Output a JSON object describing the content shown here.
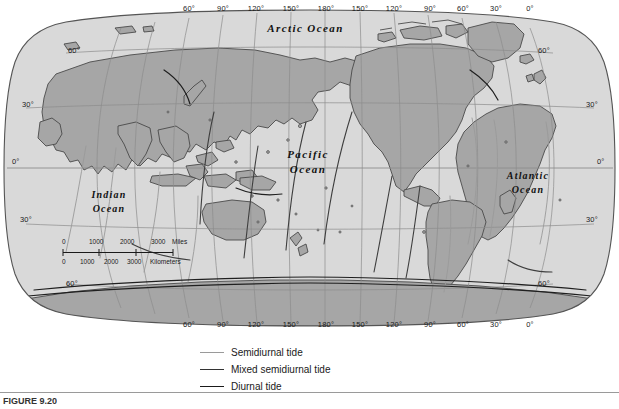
{
  "figure": {
    "caption": "FIGURE 9.20",
    "projection": "robinson-world"
  },
  "map": {
    "ocean_labels": [
      {
        "name": "arctic-ocean",
        "line1": "Arctic  Ocean",
        "x": 248,
        "y": 22,
        "w": 115,
        "size": "normal"
      },
      {
        "name": "pacific-ocean",
        "line1": "Pacific",
        "line2": "Ocean",
        "x": 272,
        "y": 148,
        "w": 72,
        "size": "normal"
      },
      {
        "name": "indian-ocean",
        "line1": "Indian",
        "line2": "Ocean",
        "x": 78,
        "y": 189,
        "w": 62,
        "size": "small"
      },
      {
        "name": "atlantic-ocean",
        "line1": "Atlantic",
        "line2": "Ocean",
        "x": 492,
        "y": 170,
        "w": 72,
        "size": "small"
      }
    ],
    "longitude_labels_top": [
      {
        "text": "60°",
        "x": 188
      },
      {
        "text": "90°",
        "x": 222
      },
      {
        "text": "120°",
        "x": 255
      },
      {
        "text": "150°",
        "x": 290
      },
      {
        "text": "180°",
        "x": 325
      },
      {
        "text": "150°",
        "x": 359
      },
      {
        "text": "120°",
        "x": 393
      },
      {
        "text": "90°",
        "x": 429
      },
      {
        "text": "60°",
        "x": 462
      },
      {
        "text": "30°",
        "x": 495
      },
      {
        "text": "0°",
        "x": 529
      }
    ],
    "longitude_labels_bottom": [
      {
        "text": "60°",
        "x": 188
      },
      {
        "text": "90°",
        "x": 222
      },
      {
        "text": "120°",
        "x": 255
      },
      {
        "text": "150°",
        "x": 290
      },
      {
        "text": "180°",
        "x": 325
      },
      {
        "text": "150°",
        "x": 359
      },
      {
        "text": "120°",
        "x": 393
      },
      {
        "text": "90°",
        "x": 429
      },
      {
        "text": "60°",
        "x": 462
      },
      {
        "text": "30°",
        "x": 495
      },
      {
        "text": "0°",
        "x": 529
      }
    ],
    "latitude_labels_left": [
      {
        "text": "60°",
        "x": 68,
        "y": 50
      },
      {
        "text": "30°",
        "x": 22,
        "y": 104
      },
      {
        "text": "0°",
        "x": 12,
        "y": 161
      },
      {
        "text": "30°",
        "x": 20,
        "y": 219
      },
      {
        "text": "60°",
        "x": 66,
        "y": 283
      }
    ],
    "latitude_labels_right": [
      {
        "text": "60°",
        "x": 538,
        "y": 50
      },
      {
        "text": "30°",
        "x": 586,
        "y": 104
      },
      {
        "text": "0°",
        "x": 597,
        "y": 161
      },
      {
        "text": "30°",
        "x": 586,
        "y": 219
      },
      {
        "text": "60°",
        "x": 538,
        "y": 283
      }
    ],
    "colors": {
      "land": "#a6a6a6",
      "ocean": "#d9d9d9",
      "coastline": "#4a4a4a",
      "graticule": "#8c8c8c",
      "frame": "#555555",
      "page": "#ffffff"
    }
  },
  "scale_bar": {
    "miles": {
      "unit": "Miles",
      "ticks": [
        "0",
        "1000",
        "2000",
        "3000"
      ]
    },
    "kilometers": {
      "unit": "Kilometers",
      "ticks": [
        "0",
        "1000",
        "2000",
        "3000"
      ]
    }
  },
  "legend": {
    "items": [
      {
        "name": "semidiurnal-tide",
        "label": "Semidiurnal tide",
        "color": "#9a9a9a",
        "weight": "1px"
      },
      {
        "name": "mixed-semidiurnal-tide",
        "label": "Mixed semidiurnal tide",
        "color": "#333333",
        "weight": "1.4px"
      },
      {
        "name": "diurnal-tide",
        "label": "Diurnal tide",
        "color": "#1a1a1a",
        "weight": "1.6px"
      }
    ]
  }
}
